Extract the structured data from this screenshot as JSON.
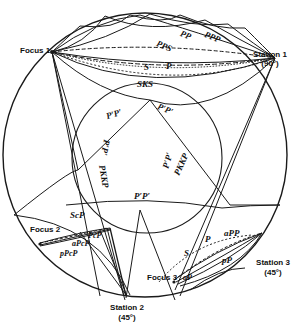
{
  "diagram": {
    "type": "seismic ray paths through Earth cross-section",
    "colors": {
      "line": "#1a1a1a",
      "background": "#ffffff"
    },
    "foci": [
      {
        "label": "Focus 1"
      },
      {
        "label": "Focus 2"
      },
      {
        "label": "Focus 3"
      }
    ],
    "stations": [
      {
        "label": "Station 1",
        "distance": "(90°)"
      },
      {
        "label": "Station 2",
        "distance": "(45°)"
      },
      {
        "label": "Station 3",
        "distance": "(45°)"
      }
    ],
    "phases": {
      "pp": "PP",
      "ppp": "PPP",
      "pps": "PPS",
      "s": "S",
      "p": "P",
      "sks": "SKS",
      "p_prime_p_prime_top_left": "P′P′",
      "p_prime_p_prime_top_right": "P′P′",
      "pp_prime_left": "P′P′",
      "pkkp_left": "PKKP",
      "p_prime_right": "P′P′",
      "pkkp_right": "PKKP",
      "p_prime_p_prime_bottom": "P′P′",
      "scp": "ScP",
      "pcp": "PcP",
      "apcp": "aPcP",
      "ppcp": "pPcP",
      "app": "aPP",
      "p3": "P",
      "s3": "S",
      "pp3": "pP",
      "ap3": "aP"
    }
  }
}
